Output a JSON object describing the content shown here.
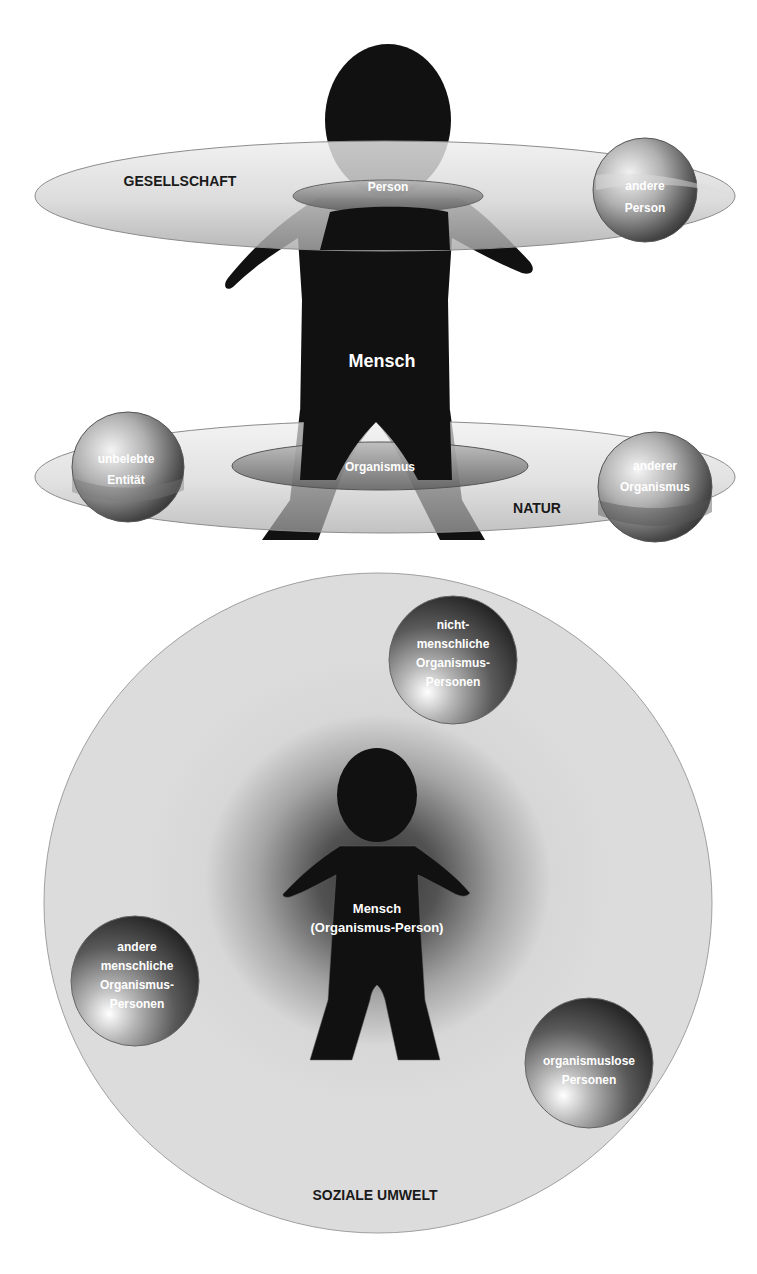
{
  "top_diagram": {
    "society_ring": {
      "label": "GESELLSCHAFT",
      "inner_label": "Person"
    },
    "nature_ring": {
      "label": "NATUR",
      "inner_label": "Organismus"
    },
    "figure_label": "Mensch",
    "spheres": [
      {
        "id": "andere-person",
        "lines": [
          "andere",
          "Person"
        ]
      },
      {
        "id": "unbelebte-entitaet",
        "lines": [
          "unbelebte",
          "Entität"
        ]
      },
      {
        "id": "anderer-organismus",
        "lines": [
          "anderer",
          "Organismus"
        ]
      }
    ]
  },
  "bottom_diagram": {
    "environment_label": "SOZIALE UMWELT",
    "figure_label_lines": [
      "Mensch",
      "(Organismus-Person)"
    ],
    "spheres": [
      {
        "id": "nichtmenschliche-organismus-personen",
        "lines": [
          "nicht-",
          "menschliche",
          "Organismus-",
          "Personen"
        ]
      },
      {
        "id": "andere-menschliche-organismus-personen",
        "lines": [
          "andere",
          "menschliche",
          "Organismus-",
          "Personen"
        ]
      },
      {
        "id": "organismuslose-personen",
        "lines": [
          "organismuslose",
          "Personen"
        ]
      }
    ]
  },
  "colors": {
    "figure": "#111111",
    "ring_fill_light": "#e6e6e6",
    "ring_fill_dark": "#9a9a9a",
    "ring_stroke": "#8c8c8c",
    "environment_fill": "#dcdcdc",
    "label_dark": "#1a1a1a",
    "label_light": "#ffffff"
  }
}
